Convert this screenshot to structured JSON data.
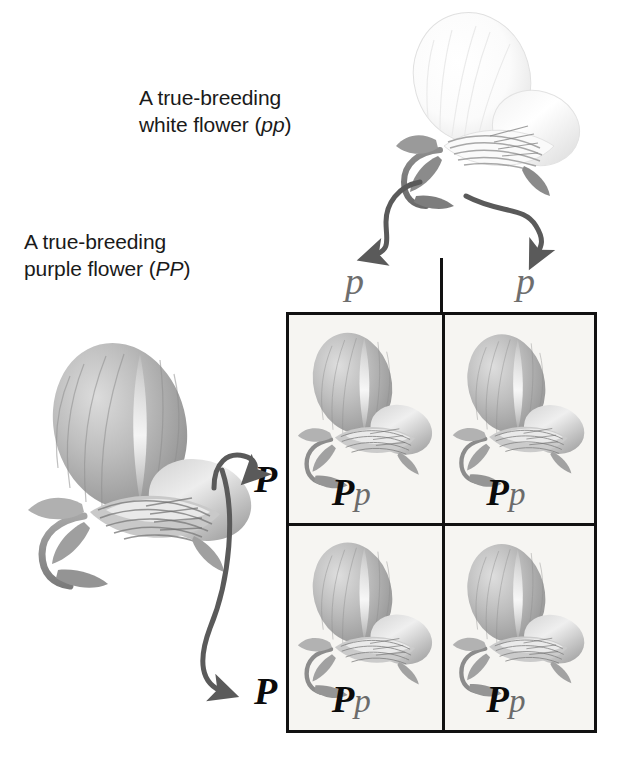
{
  "figure": {
    "background_color": "#ffffff"
  },
  "labels": {
    "white_parent": {
      "line1": "A true-breeding",
      "line2_prefix": "white flower (",
      "line2_genotype": "pp",
      "line2_suffix": ")"
    },
    "purple_parent": {
      "line1": "A true-breeding",
      "line2_prefix": "purple flower (",
      "line2_genotype": "PP",
      "line2_suffix": ")"
    }
  },
  "gametes": {
    "top": [
      {
        "allele": "p",
        "color": "#6e6e6e"
      },
      {
        "allele": "p",
        "color": "#6e6e6e"
      }
    ],
    "left": [
      {
        "allele": "P",
        "color": "#0b0b0b"
      },
      {
        "allele": "P",
        "color": "#0b0b0b"
      }
    ]
  },
  "grid": {
    "border_color": "#111111",
    "cell_background": "#f6f5f2",
    "cells": [
      {
        "row": 1,
        "col": 1,
        "dominant": "P",
        "recessive": "p",
        "phenotype": "purple-flower"
      },
      {
        "row": 1,
        "col": 2,
        "dominant": "P",
        "recessive": "p",
        "phenotype": "purple-flower"
      },
      {
        "row": 2,
        "col": 1,
        "dominant": "P",
        "recessive": "p",
        "phenotype": "purple-flower"
      },
      {
        "row": 2,
        "col": 2,
        "dominant": "P",
        "recessive": "p",
        "phenotype": "purple-flower"
      }
    ]
  },
  "colors": {
    "text": "#1a1a1a",
    "dominant_allele": "#0b0b0b",
    "recessive_allele": "#6e6e6e",
    "arrow": "#5a5a5a",
    "grid_line": "#111111"
  },
  "icons": {
    "white_flower": "pea-flower-white-icon",
    "purple_flower": "pea-flower-purple-icon",
    "arrow": "curved-arrow-icon"
  }
}
